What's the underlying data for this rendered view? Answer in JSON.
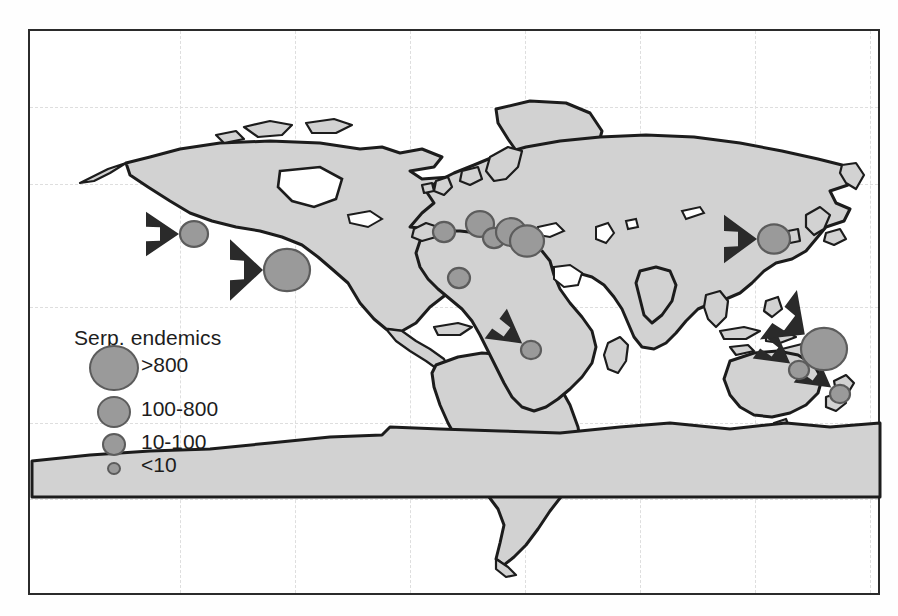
{
  "figure": {
    "type": "world-distribution-map",
    "background": "#ffffff",
    "frame_color": "#2b2b2b",
    "land_fill": "#d2d2d2",
    "land_stroke": "#1c1c1c",
    "ocean_fill": "#ffffff",
    "grid_color": "#dedede",
    "marker_fill": "#9a9a9a",
    "marker_stroke": "#5c5c5c",
    "arrow_color": "#2a2a2a"
  },
  "legend": {
    "title": "Serp. endemics",
    "entries": [
      {
        "label": ">800",
        "radius_px": 23,
        "class": "largest"
      },
      {
        "label": "100-800",
        "radius_px": 15,
        "class": "large"
      },
      {
        "label": "10-100",
        "radius_px": 10,
        "class": "medium"
      },
      {
        "label": "<10",
        "radius_px": 5,
        "class": "smallest"
      }
    ]
  },
  "chart_data": {
    "type": "scatter",
    "title": "Serp. endemics",
    "xlabel": "",
    "ylabel": "",
    "grid": true,
    "legend_position": "inside-lower-left",
    "size_classes": [
      {
        "label": ">800",
        "radius_px": 23
      },
      {
        "label": "100-800",
        "radius_px": 15
      },
      {
        "label": "10-100",
        "radius_px": 10
      },
      {
        "label": "<10",
        "radius_px": 5
      }
    ],
    "markers": [
      {
        "name": "western-north-america",
        "x": 164,
        "y": 203,
        "r": 14,
        "size_class": "100-800",
        "arrow": true,
        "arrow_from": "west"
      },
      {
        "name": "mexico-caribbean",
        "x": 257,
        "y": 239,
        "r": 23,
        "size_class": ">800",
        "arrow": true,
        "arrow_from": "west"
      },
      {
        "name": "iberia-morocco",
        "x": 414,
        "y": 201,
        "r": 11,
        "size_class": "100-800",
        "arrow": false,
        "arrow_from": ""
      },
      {
        "name": "italy-alps",
        "x": 450,
        "y": 193,
        "r": 14,
        "size_class": "100-800",
        "arrow": false,
        "arrow_from": ""
      },
      {
        "name": "balkans",
        "x": 464,
        "y": 207,
        "r": 11,
        "size_class": "100-800",
        "arrow": false,
        "arrow_from": ""
      },
      {
        "name": "anatolia-turkey",
        "x": 481,
        "y": 201,
        "r": 15,
        "size_class": "100-800",
        "arrow": false,
        "arrow_from": ""
      },
      {
        "name": "cuba-caucasus-east",
        "x": 497,
        "y": 210,
        "r": 17,
        "size_class": "100-800",
        "arrow": false,
        "arrow_from": ""
      },
      {
        "name": "west-africa",
        "x": 429,
        "y": 247,
        "r": 11,
        "size_class": "100-800",
        "arrow": false,
        "arrow_from": ""
      },
      {
        "name": "southern-africa",
        "x": 501,
        "y": 319,
        "r": 10,
        "size_class": "10-100",
        "arrow": true,
        "arrow_from": "northwest"
      },
      {
        "name": "east-asia-japan",
        "x": 744,
        "y": 208,
        "r": 16,
        "size_class": "100-800",
        "arrow": true,
        "arrow_from": "west"
      },
      {
        "name": "southeast-australia",
        "x": 769,
        "y": 339,
        "r": 10,
        "size_class": "10-100",
        "arrow": true,
        "arrow_from": "northwest"
      },
      {
        "name": "new-caledonia",
        "x": 794,
        "y": 318,
        "r": 23,
        "size_class": ">800",
        "arrow": true,
        "arrow_from": "northwest"
      },
      {
        "name": "new-zealand",
        "x": 810,
        "y": 363,
        "r": 10,
        "size_class": "10-100",
        "arrow": true,
        "arrow_from": "northwest"
      }
    ],
    "grid_lines": {
      "vertical_x": [
        150,
        265,
        380,
        495,
        610,
        725,
        840
      ],
      "horizontal_y": [
        76,
        153,
        276,
        392,
        468
      ]
    }
  }
}
